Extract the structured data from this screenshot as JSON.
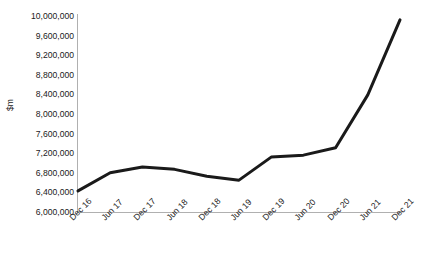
{
  "chart_data": {
    "type": "line",
    "title": "",
    "xlabel": "",
    "ylabel": "$m",
    "categories": [
      "Dec 16",
      "Jun 17",
      "Dec 17",
      "Jun 18",
      "Dec 18",
      "Jun 19",
      "Dec 19",
      "Jun 20",
      "Dec 20",
      "Jun 21",
      "Dec 21"
    ],
    "values": [
      6430000,
      6800000,
      6920000,
      6870000,
      6730000,
      6650000,
      7120000,
      7160000,
      7310000,
      8390000,
      9920000
    ],
    "ylim": [
      6000000,
      10000000
    ],
    "ytick_step": 400000,
    "ytick_labels": [
      "10,000,000",
      "9,600,000",
      "9,200,000",
      "8,800,000",
      "8,400,000",
      "8,000,000",
      "7,600,000",
      "7,200,000",
      "6,800,000",
      "6,400,000",
      "6,000,000"
    ],
    "grid": false,
    "legend": false,
    "series_color": "#1a1a1a",
    "axis_color": "#b0b0b0",
    "line_width": 3
  }
}
